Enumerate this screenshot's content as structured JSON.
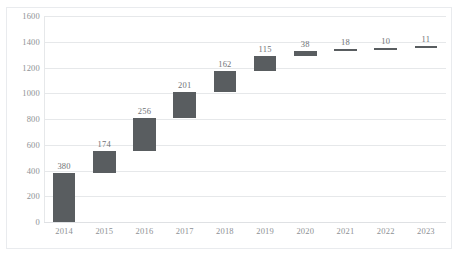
{
  "chart_data": {
    "type": "bar",
    "chart_subtype": "waterfall",
    "title": "",
    "xlabel": "",
    "ylabel": "",
    "categories": [
      "2014",
      "2015",
      "2016",
      "2017",
      "2018",
      "2019",
      "2020",
      "2021",
      "2022",
      "2023"
    ],
    "values": [
      380,
      174,
      256,
      201,
      162,
      115,
      38,
      18,
      10,
      11
    ],
    "data_labels": [
      "380",
      "174",
      "256",
      "201",
      "162",
      "115",
      "38",
      "18",
      "10",
      "11"
    ],
    "cumulative_start": [
      0,
      380,
      554,
      810,
      1011,
      1173,
      1288,
      1326,
      1344,
      1354
    ],
    "cumulative_end": [
      380,
      554,
      810,
      1011,
      1173,
      1288,
      1326,
      1344,
      1354,
      1365
    ],
    "ylim": [
      0,
      1600
    ],
    "ytick_values": [
      0,
      200,
      400,
      600,
      800,
      1000,
      1200,
      1400,
      1600
    ],
    "ytick_labels": [
      "0",
      "200",
      "400",
      "600",
      "800",
      "1000",
      "1200",
      "1400",
      "1600"
    ],
    "grid": true,
    "legend": "none",
    "bar_color": "#595d60",
    "gridline_color": "#e6e8ea",
    "axis_text_color": "#8e9195",
    "label_text_color": "#6f7376",
    "background_color": "#ffffff",
    "border_color": "#e9ebee"
  }
}
